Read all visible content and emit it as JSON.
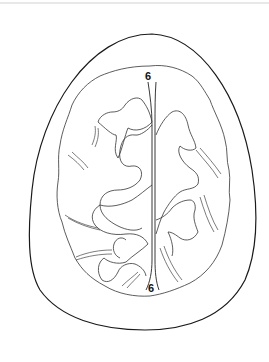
{
  "diagram": {
    "labels": {
      "top": "6",
      "bottom": "6"
    },
    "colors": {
      "line": "#1a1a1a",
      "background": "#ffffff"
    }
  }
}
